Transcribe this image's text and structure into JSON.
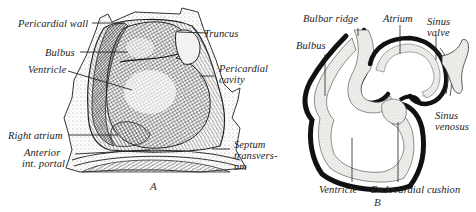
{
  "figure_a": {
    "caption": "A",
    "labels": {
      "pericardial_wall": "Pericardial wall",
      "bulbus": "Bulbus",
      "ventricle": "Ventricle",
      "right_atrium": "Right atrium",
      "anterior_portal_1": "Anterior",
      "anterior_portal_2": "int. portal",
      "truncus": "Truncus",
      "pericardial_cavity_1": "Pericardial",
      "pericardial_cavity_2": "cavity",
      "septum_1": "Septum",
      "septum_2": "transvers-",
      "septum_3": "um"
    }
  },
  "figure_b": {
    "caption": "B",
    "labels": {
      "bulbar_ridge": "Bulbar ridge",
      "atrium": "Atrium",
      "sinus_valve_1": "Sinus",
      "sinus_valve_2": "valve",
      "bulbus": "Bulbus",
      "sinus_venosus_1": "Sinus",
      "sinus_venosus_2": "venosus",
      "ventricle": "Ventricle",
      "endocardial_cushion": "Endocardial cushion"
    }
  },
  "colors": {
    "ink": "#1a1a1a",
    "stipple": "#e8e6e0",
    "shade": "#6a6a6a"
  }
}
